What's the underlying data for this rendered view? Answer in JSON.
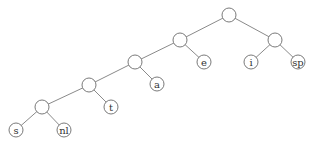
{
  "diagram": {
    "type": "binary-tree",
    "nodes": [
      {
        "id": "root",
        "label": ""
      },
      {
        "id": "n1",
        "label": ""
      },
      {
        "id": "n2",
        "label": ""
      },
      {
        "id": "n3",
        "label": ""
      },
      {
        "id": "e",
        "label": "e"
      },
      {
        "id": "i",
        "label": "i"
      },
      {
        "id": "sp",
        "label": "sp"
      },
      {
        "id": "n4",
        "label": ""
      },
      {
        "id": "a",
        "label": "a"
      },
      {
        "id": "n5",
        "label": ""
      },
      {
        "id": "t",
        "label": "t"
      },
      {
        "id": "s",
        "label": "s"
      },
      {
        "id": "nl",
        "label": "nl"
      }
    ],
    "edges": [
      [
        "root",
        "n1"
      ],
      [
        "root",
        "n2"
      ],
      [
        "n1",
        "n3"
      ],
      [
        "n1",
        "e"
      ],
      [
        "n2",
        "i"
      ],
      [
        "n2",
        "sp"
      ],
      [
        "n3",
        "n4"
      ],
      [
        "n3",
        "a"
      ],
      [
        "n4",
        "n5"
      ],
      [
        "n4",
        "t"
      ],
      [
        "n5",
        "s"
      ],
      [
        "n5",
        "nl"
      ]
    ]
  }
}
